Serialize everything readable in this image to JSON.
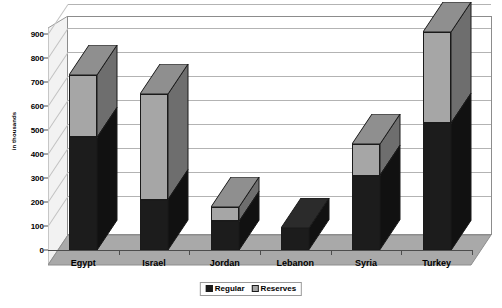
{
  "chart_data": {
    "type": "bar",
    "subtype": "stacked-column-3d",
    "title": "",
    "xlabel": "",
    "ylabel": "in thousands",
    "ylim": [
      0,
      900
    ],
    "ytick_step": 100,
    "yticks": [
      0,
      100,
      200,
      300,
      400,
      500,
      600,
      700,
      800,
      900
    ],
    "ytick_labels": [
      "0",
      "100",
      "200",
      "300",
      "400",
      "500",
      "600",
      "700",
      "800",
      "900"
    ],
    "grid": true,
    "grid_axis": "y",
    "legend_position": "bottom-center",
    "categories": [
      "Egypt",
      "Israel",
      "Jordan",
      "Lebanon",
      "Syria",
      "Turkey"
    ],
    "series": [
      {
        "name": "Regular",
        "color": "#1c1c1c",
        "values": [
          470,
          210,
          120,
          90,
          310,
          530
        ]
      },
      {
        "name": "Reserves",
        "color": "#a6a6a6",
        "values": [
          260,
          440,
          60,
          0,
          130,
          380
        ]
      }
    ],
    "totals": [
      730,
      650,
      180,
      90,
      440,
      910
    ]
  },
  "legend": {
    "items": [
      {
        "label": "Regular",
        "swatch": "regular"
      },
      {
        "label": "Reserves",
        "swatch": "reserves"
      }
    ]
  },
  "colors": {
    "regular": "#1c1c1c",
    "reserves": "#a6a6a6",
    "floor": "#a9a9a9",
    "sidewall": "#f2f2f2",
    "gridline": "#b3b3b3",
    "axis": "#4d4d4d",
    "plot_background": "#ffffff"
  }
}
